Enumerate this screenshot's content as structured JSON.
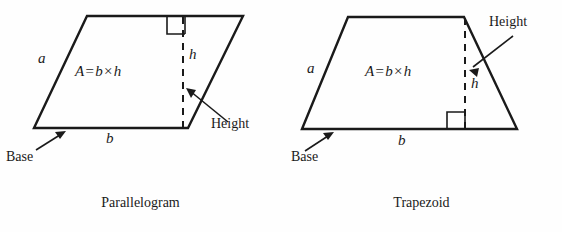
{
  "page": {
    "background_color": "#fefefe",
    "ink_color": "#1a1a1a",
    "width": 562,
    "height": 232
  },
  "figures": [
    {
      "id": "parallelogram",
      "caption": "Parallelogram",
      "shape_type": "parallelogram",
      "formula": {
        "lhs": "A",
        "equals": "=",
        "base": "b",
        "times": "×",
        "height": "h"
      },
      "labels": {
        "side_a": "a",
        "base_b": "b",
        "height_h": "h",
        "base_callout": "Base",
        "height_callout": "Height"
      },
      "annotations": {
        "right_angle": "right-angle-marker",
        "height_line_style": "dashed"
      }
    },
    {
      "id": "trapezoid",
      "caption": "Trapezoid",
      "shape_type": "trapezoid",
      "formula": {
        "lhs": "A",
        "equals": "=",
        "base": "b",
        "times": "×",
        "height": "h"
      },
      "labels": {
        "side_a": "a",
        "base_b": "b",
        "height_h": "h",
        "base_callout": "Base",
        "height_callout": "Height"
      },
      "annotations": {
        "right_angle": "right-angle-marker",
        "height_line_style": "dashed"
      }
    }
  ]
}
